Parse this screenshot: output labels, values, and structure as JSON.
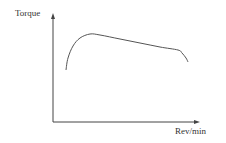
{
  "chart_data": {
    "type": "line",
    "title": "",
    "xlabel": "Rev/min",
    "ylabel": "Torque",
    "grid": false,
    "legend": null,
    "axis_ticks": "none (qualitative sketch)",
    "series": [
      {
        "name": "Torque curve",
        "description": "Torque rises steeply from low rev/min to a peak, then declines gradually and linearly, then drops sharply at high rev/min",
        "points_px": [
          [
            66,
            70
          ],
          [
            68,
            58
          ],
          [
            73,
            46
          ],
          [
            80,
            38
          ],
          [
            90,
            34
          ],
          [
            100,
            35
          ],
          [
            120,
            39
          ],
          [
            140,
            43
          ],
          [
            160,
            47
          ],
          [
            178,
            50
          ],
          [
            182,
            53
          ],
          [
            186,
            58
          ],
          [
            188,
            62
          ]
        ],
        "points_normalized": [
          [
            0.09,
            0.58
          ],
          [
            0.1,
            0.73
          ],
          [
            0.14,
            0.89
          ],
          [
            0.19,
            0.94
          ],
          [
            0.25,
            1.0
          ],
          [
            0.32,
            0.99
          ],
          [
            0.46,
            0.94
          ],
          [
            0.6,
            0.89
          ],
          [
            0.73,
            0.84
          ],
          [
            0.86,
            0.81
          ],
          [
            0.88,
            0.77
          ],
          [
            0.91,
            0.71
          ],
          [
            0.93,
            0.66
          ]
        ]
      }
    ],
    "axes": {
      "origin_px": [
        53,
        122
      ],
      "y_axis_top_px": [
        53,
        14
      ],
      "x_axis_end_px": [
        199,
        122
      ]
    },
    "colors": {
      "curve": "#555555",
      "axes": "#444444",
      "text": "#333333"
    }
  }
}
